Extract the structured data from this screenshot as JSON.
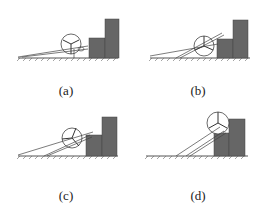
{
  "figure": {
    "colors": {
      "block": "#666666",
      "block_edge": "#444444",
      "line": "#333333",
      "ground": "#555555",
      "wheel": "#444444"
    },
    "panels": [
      {
        "label": "(a)",
        "stage": "wheel approaching step, arm trailing flat"
      },
      {
        "label": "(b)",
        "stage": "arm rotating upward to contact step"
      },
      {
        "label": "(c)",
        "stage": "arm lifting wheel against step edge"
      },
      {
        "label": "(d)",
        "stage": "wheel raised onto step top"
      }
    ]
  }
}
